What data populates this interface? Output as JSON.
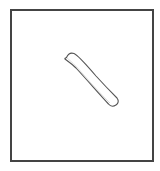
{
  "canvas": {
    "background": "#ffffff",
    "frame_color": "#444444",
    "stroke_color": "#555555"
  },
  "shapes": [
    {
      "type": "rounded-rectangle",
      "description": "hand-drawn rotated bar",
      "rotation_deg": 45
    }
  ]
}
